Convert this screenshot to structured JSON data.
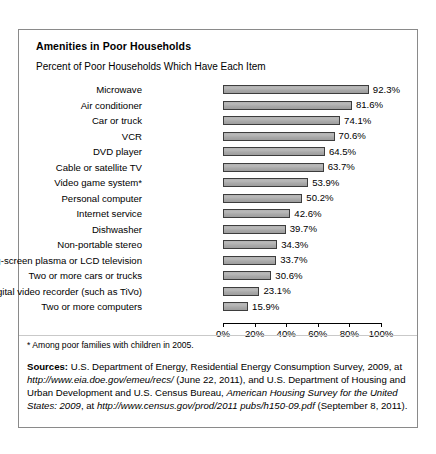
{
  "chart_data": {
    "type": "bar",
    "orientation": "horizontal",
    "title": "Amenities in Poor Households",
    "subtitle": "Percent of Poor Households Which Have Each Item",
    "xlabel": "",
    "ylabel": "",
    "xlim": [
      0,
      100
    ],
    "grid": false,
    "legend": "none",
    "categories": [
      "Microwave",
      "Air conditioner",
      "Car or truck",
      "VCR",
      "DVD player",
      "Cable or satellite TV",
      "Video game system*",
      "Personal computer",
      "Internet service",
      "Dishwasher",
      "Non-portable stereo",
      "Big-screen plasma or LCD television",
      "Two or more cars or trucks",
      "Digital video recorder (such as TiVo)",
      "Two or more computers"
    ],
    "values": [
      92.3,
      81.6,
      74.1,
      70.6,
      64.5,
      63.7,
      53.9,
      50.2,
      42.6,
      39.7,
      34.3,
      33.7,
      30.6,
      23.1,
      15.9
    ],
    "value_labels": [
      "92.3%",
      "81.6%",
      "74.1%",
      "70.6%",
      "64.5%",
      "63.7%",
      "53.9%",
      "50.2%",
      "42.6%",
      "39.7%",
      "34.3%",
      "33.7%",
      "30.6%",
      "23.1%",
      "15.9%"
    ],
    "x_ticks": [
      0,
      20,
      40,
      60,
      80,
      100
    ],
    "x_tick_labels": [
      "0%",
      "20%",
      "40%",
      "60%",
      "80%",
      "100%"
    ],
    "bar_fill_color": "#b0b0b0",
    "bar_edge_color": "#3d3d3d"
  },
  "notes": {
    "footnote": "* Among poor families with children in 2005.",
    "sources_label": "Sources:",
    "sources_seg_1": " U.S. Department of Energy, Residential Energy Consumption Survey, 2009, at ",
    "sources_url_1": "http://www.eia.doe.gov/emeu/recs/",
    "sources_seg_2": " (June 22, 2011), and U.S. Department of Housing and Urban Development and U.S. Census Bureau, ",
    "sources_pub_2": "American Housing Survey for the United States: 2009",
    "sources_seg_3": ", at ",
    "sources_url_2": "http://www.census.gov/prod/2011 pubs/h150-09.pdf",
    "sources_seg_4": " (September 8, 2011)."
  }
}
